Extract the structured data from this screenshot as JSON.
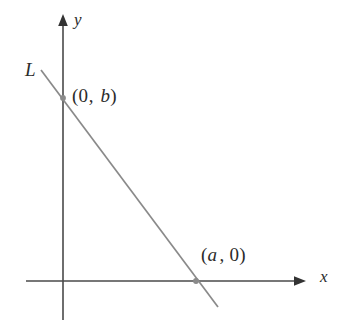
{
  "figure": {
    "kind": "coordinate-plane-line-diagram",
    "background_color": "#ffffff",
    "width": 345,
    "height": 331,
    "axis_color": "#4a4a4a",
    "line_color": "#8a8a8a",
    "point_color": "#8a8a8a",
    "text_color": "#2b2b2b"
  },
  "axes": {
    "x_axis": {
      "label": "x",
      "name": "horizontal axis",
      "y_pixel": 281,
      "x_start": 26,
      "x_end": 306,
      "arrow": "right"
    },
    "y_axis": {
      "label": "y",
      "name": "vertical axis",
      "x_pixel": 63,
      "y_top": 14,
      "y_bottom": 320,
      "arrow": "up"
    },
    "origin": {
      "x_pixel": 63,
      "y_pixel": 281
    }
  },
  "line": {
    "label": "L",
    "start": {
      "x": 41,
      "y": 70
    },
    "end": {
      "x": 218,
      "y": 307
    }
  },
  "points": [
    {
      "name": "y-intercept",
      "label_open": "(",
      "label_first": "0",
      "label_first_italic": false,
      "label_sep": ",",
      "label_second": "b",
      "label_second_italic": true,
      "label_close": ")",
      "label_text": "(0, b)",
      "x_pixel": 63,
      "y_pixel": 98
    },
    {
      "name": "x-intercept",
      "label_open": "(",
      "label_first": "a",
      "label_first_italic": true,
      "label_sep": ",",
      "label_second": "0",
      "label_second_italic": false,
      "label_close": ")",
      "label_text": "(a , 0)",
      "x_pixel": 196,
      "y_pixel": 281
    }
  ],
  "chart_data": {
    "type": "line",
    "title": "",
    "xlabel": "x",
    "ylabel": "y",
    "annotations": [
      "L",
      "(0, b)",
      "(a , 0)"
    ],
    "series": [
      {
        "name": "L",
        "description": "straight line with negative slope through (0, b) and (a, 0)",
        "points": [
          {
            "x_label": "0",
            "y_label": "b"
          },
          {
            "x_label": "a",
            "y_label": "0"
          }
        ]
      }
    ],
    "grid": false,
    "legend": "none"
  }
}
